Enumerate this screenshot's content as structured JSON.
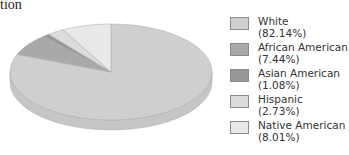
{
  "title": "tion",
  "chart_data": {
    "type": "pie",
    "title": "tion",
    "style": "3d",
    "categories": [
      "White",
      "African American",
      "Asian American",
      "Hispanic",
      "Native American"
    ],
    "values": [
      82.14,
      7.44,
      1.08,
      2.73,
      8.01
    ],
    "colors": [
      "#cfcfcf",
      "#a9a9a9",
      "#979797",
      "#dcdcdc",
      "#e8e8e8"
    ],
    "legend_position": "right"
  },
  "legend": {
    "items": [
      {
        "name": "White",
        "pct": "(82.14%)",
        "color": "#cfcfcf"
      },
      {
        "name": "African American",
        "pct": "(7.44%)",
        "color": "#a9a9a9"
      },
      {
        "name": "Asian American",
        "pct": "(1.08%)",
        "color": "#979797"
      },
      {
        "name": "Hispanic",
        "pct": "(2.73%)",
        "color": "#dcdcdc"
      },
      {
        "name": "Native American",
        "pct": "(8.01%)",
        "color": "#e8e8e8"
      }
    ]
  }
}
